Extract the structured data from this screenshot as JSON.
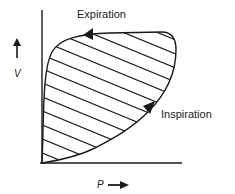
{
  "diagram": {
    "type": "pressure-volume loop",
    "labels": {
      "expiration": "Expiration",
      "inspiration": "Inspiration",
      "y_axis": "V",
      "x_axis": "P"
    },
    "colors": {
      "ink": "#1a1a1a",
      "background": "#ffffff"
    }
  }
}
